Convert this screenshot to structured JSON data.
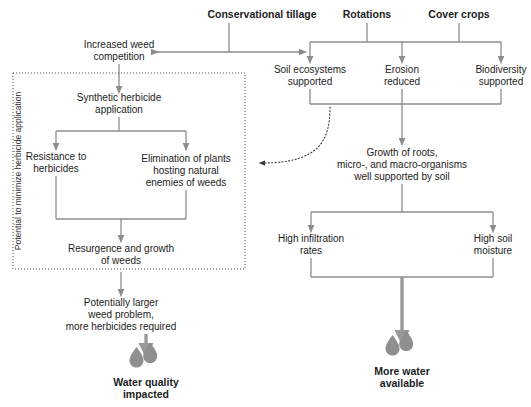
{
  "diagram": {
    "title_nodes": [
      {
        "id": "conservational-tillage",
        "label": "Conservational tillage"
      },
      {
        "id": "rotations",
        "label": "Rotations"
      },
      {
        "id": "cover-crops",
        "label": "Cover crops"
      }
    ],
    "left_branch": {
      "region_label": "Potential to minimize herbicide application",
      "nodes": [
        {
          "id": "increased-weed-competition",
          "line1": "Increased weed",
          "line2": "competition"
        },
        {
          "id": "synthetic-herbicide-application",
          "line1": "Synthetic herbicide",
          "line2": "application"
        },
        {
          "id": "resistance-to-herbicides",
          "line1": "Resistance to",
          "line2": "herbicides"
        },
        {
          "id": "elimination-of-plants",
          "line1": "Elimination of plants",
          "line2": "hosting natural",
          "line3": "enemies of weeds"
        },
        {
          "id": "resurgence-growth-weeds",
          "line1": "Resurgence and growth",
          "line2": "of weeds"
        },
        {
          "id": "potentially-larger-weed-problem",
          "line1": "Potentially larger",
          "line2": "weed problem,",
          "line3": "more herbicides required"
        }
      ],
      "outcome": {
        "id": "water-quality-impacted",
        "line1": "Water quality",
        "line2": "impacted",
        "icon": "water-drops-icon"
      }
    },
    "right_branch": {
      "nodes": [
        {
          "id": "soil-ecosystems-supported",
          "line1": "Soil ecosystems",
          "line2": "supported"
        },
        {
          "id": "erosion-reduced",
          "line1": "Erosion",
          "line2": "reduced"
        },
        {
          "id": "biodiversity-supported",
          "line1": "Biodiversity",
          "line2": "supported"
        },
        {
          "id": "growth-of-roots",
          "line1": "Growth of roots,",
          "line2": "micro-, and macro-organisms",
          "line3": "well supported by soil"
        },
        {
          "id": "high-infiltration-rates",
          "line1": "High infiltration",
          "line2": "rates"
        },
        {
          "id": "high-soil-moisture",
          "line1": "High soil",
          "line2": "moisture"
        }
      ],
      "outcome": {
        "id": "more-water-available",
        "line1": "More water",
        "line2": "available",
        "icon": "water-drops-icon"
      }
    },
    "colors": {
      "line": "#8d8d8d",
      "thick_line": "#9a9a9a",
      "drop": "#8f8f8f",
      "text": "#1c1c1c",
      "dotted": "#4a4a4a",
      "background": "#ffffff"
    }
  }
}
